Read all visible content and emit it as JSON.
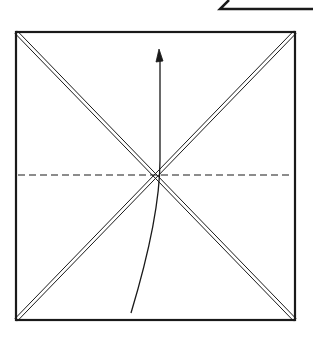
{
  "diagram": {
    "ink_color": "#1a1a1a",
    "background_color": "#ffffff",
    "elements": {
      "paper_square": "square sheet outline",
      "diagonal_creases": "two diagonal creases (double lines)",
      "valley_fold_line": "horizontal dashed valley fold line",
      "fold_arrow": "curved arrow indicating fold bottom edge up",
      "previous_step_fragment": "partial outline of previous step at top-right"
    }
  }
}
